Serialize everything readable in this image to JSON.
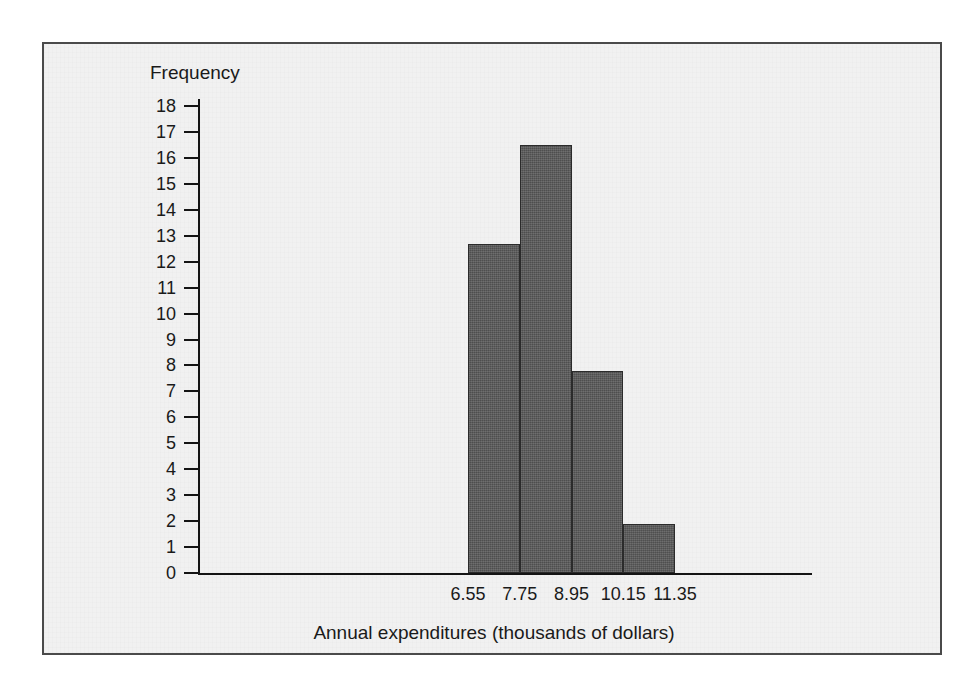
{
  "figure": {
    "background_color": "#f1f1f1",
    "border_color": "#4a4a4a",
    "bar_color": "#595959",
    "axis_color": "#141414"
  },
  "chart_data": {
    "type": "bar",
    "title": "",
    "subtitle": "",
    "xlabel": "Annual expenditures (thousands of dollars)",
    "ylabel": "Frequency",
    "grid": false,
    "legend": "none",
    "ylim": [
      0,
      18
    ],
    "ytick_labels": [
      "18",
      "17",
      "16",
      "15",
      "14",
      "13",
      "12",
      "11",
      "10",
      "9",
      "8",
      "7",
      "6",
      "5",
      "4",
      "3",
      "2",
      "1",
      "0"
    ],
    "ytick_values": [
      18,
      17,
      16,
      15,
      14,
      13,
      12,
      11,
      10,
      9,
      8,
      7,
      6,
      5,
      4,
      3,
      2,
      1,
      0
    ],
    "bin_edges": [
      6.55,
      7.75,
      8.95,
      10.15,
      11.35
    ],
    "bin_edge_labels": [
      "6.55",
      "7.75",
      "8.95",
      "10.15",
      "11.35"
    ],
    "categories": [
      "6.55-7.75",
      "7.75-8.95",
      "8.95-10.15",
      "10.15-11.35"
    ],
    "values": [
      12.7,
      16.5,
      7.8,
      1.9
    ],
    "xlim": [
      6.55,
      11.35
    ]
  }
}
